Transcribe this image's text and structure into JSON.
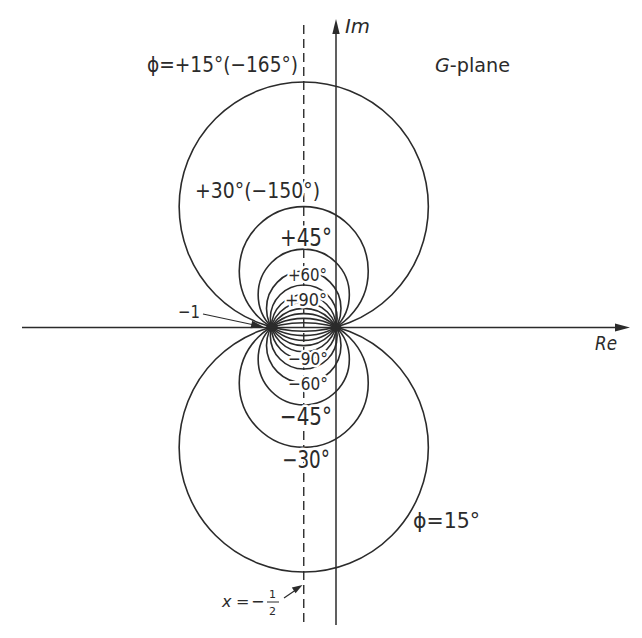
{
  "figure": {
    "plane_label": {
      "var": "G",
      "rest": "-plane"
    },
    "axes": {
      "real": "Re",
      "imag": "Im"
    },
    "critical_point": {
      "label": "−1"
    },
    "asymptote": {
      "var": "x",
      "equals": "=",
      "sign": "−",
      "numerator": "1",
      "denominator": "2"
    },
    "labels": {
      "phi_15_upper": "ϕ=+15°(−165°)",
      "phi_30_upper": "+30°(−150°)",
      "phi_45_upper": "+45°",
      "phi_60_upper": "+60°",
      "phi_90_upper": "+90°",
      "phi_90_lower": "−90°",
      "phi_60_lower": "−60°",
      "phi_45_lower": "−45°",
      "phi_30_lower": "−30°",
      "phi_15_lower": "ϕ=15°"
    }
  },
  "loci": {
    "circles": [
      {
        "phi_deg": 15,
        "cx": 303.75,
        "cy": 206.6,
        "r": 124.6
      },
      {
        "phi_deg": 30,
        "cx": 303.75,
        "cy": 271.1,
        "r": 64.5
      },
      {
        "phi_deg": 45,
        "cx": 303.75,
        "cy": 294.75,
        "r": 45.6
      },
      {
        "phi_deg": 60,
        "cx": 303.75,
        "cy": 308.4,
        "r": 37.24
      },
      {
        "phi_deg": 75,
        "cx": 303.75,
        "cy": 318.36,
        "r": 33.39
      },
      {
        "phi_deg": 90,
        "cx": 303.75,
        "cy": 327,
        "r": 32.25
      },
      {
        "phi_deg": -75,
        "cx": 303.75,
        "cy": 335.64,
        "r": 33.39
      },
      {
        "phi_deg": -60,
        "cx": 303.75,
        "cy": 345.6,
        "r": 37.24
      },
      {
        "phi_deg": -45,
        "cx": 303.75,
        "cy": 359.25,
        "r": 45.6
      },
      {
        "phi_deg": -30,
        "cx": 303.75,
        "cy": 382.9,
        "r": 64.5
      },
      {
        "phi_deg": -15,
        "cx": 303.75,
        "cy": 447.4,
        "r": 124.6
      }
    ]
  },
  "style": {
    "ink": "#2b2b2b",
    "background": "#ffffff"
  }
}
